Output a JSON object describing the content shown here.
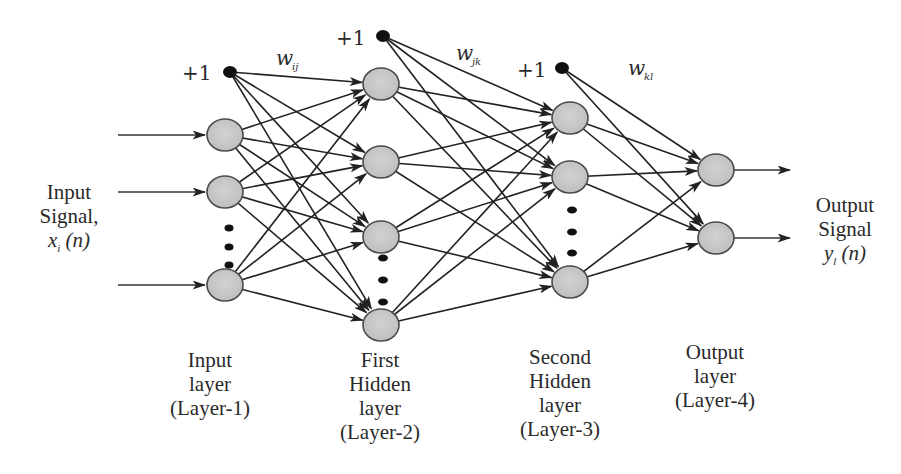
{
  "diagram": {
    "input_signal": {
      "line1": "Input",
      "line2": "Signal,",
      "math_var": "x",
      "math_sub": "i",
      "math_arg": "(n)"
    },
    "output_signal": {
      "line1": "Output",
      "line2": "Signal",
      "math_var": "y",
      "math_sub": "l",
      "math_arg": "(n)"
    },
    "bias_label": "+1",
    "weights": [
      {
        "symbol": "w",
        "sub": "ij"
      },
      {
        "symbol": "w",
        "sub": "jk"
      },
      {
        "symbol": "w",
        "sub": "kl"
      }
    ],
    "layers": [
      {
        "id": "input",
        "lines": [
          "Input",
          "layer",
          "(Layer-1)"
        ]
      },
      {
        "id": "hidden1",
        "lines": [
          "First",
          "Hidden",
          "layer",
          "(Layer-2)"
        ]
      },
      {
        "id": "hidden2",
        "lines": [
          "Second",
          "Hidden",
          "layer",
          "(Layer-3)"
        ]
      },
      {
        "id": "output",
        "lines": [
          "Output",
          "layer",
          "(Layer-4)"
        ]
      }
    ],
    "colors": {
      "node_fill": "#c8c8c8",
      "node_stroke": "#4a4a4a",
      "edge": "#222222",
      "bias": "#111111"
    }
  }
}
